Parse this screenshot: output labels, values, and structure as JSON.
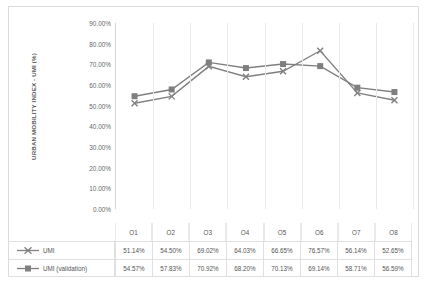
{
  "chart_data": {
    "type": "line",
    "title": "",
    "xlabel": "",
    "ylabel": "URBAN MOBILITY INDEX - UMI (%)",
    "categories": [
      "O1",
      "O2",
      "O3",
      "O4",
      "O5",
      "O6",
      "O7",
      "O8"
    ],
    "series": [
      {
        "name": "UMI",
        "marker": "cross",
        "values": [
          51.14,
          54.5,
          69.02,
          64.03,
          66.65,
          76.57,
          56.14,
          52.65
        ],
        "labels": [
          "51.14%",
          "54.50%",
          "69.02%",
          "64.03%",
          "66.65%",
          "76.57%",
          "56.14%",
          "52.65%"
        ]
      },
      {
        "name": "UMI (validation)",
        "marker": "square",
        "values": [
          54.57,
          57.83,
          70.92,
          68.2,
          70.13,
          69.14,
          58.71,
          56.59
        ],
        "labels": [
          "54.57%",
          "57.83%",
          "70.92%",
          "68.20%",
          "70.13%",
          "69.14%",
          "58.71%",
          "56.59%"
        ]
      }
    ],
    "ylim": [
      0,
      90
    ],
    "ytick_labels": [
      "90.00%",
      "80.00%",
      "70.00%",
      "60.00%",
      "50.00%",
      "40.00%",
      "30.00%",
      "20.00%",
      "10.00%",
      "0.00%"
    ],
    "ytick_values": [
      90,
      80,
      70,
      60,
      50,
      40,
      30,
      20,
      10,
      0
    ],
    "grid": {
      "vertical": true,
      "horizontal": false
    },
    "legend_position": "data-table",
    "colors": {
      "series_line": "#808080",
      "series_validation_line": "#7f7f7f",
      "gridline": "#e9e9e9",
      "axis": "#d6d6d6",
      "text": "#555555",
      "border": "#dcdcdc"
    }
  }
}
